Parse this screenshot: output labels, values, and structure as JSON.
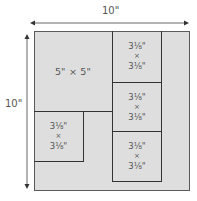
{
  "diagram": {
    "width_label": "10\"",
    "height_label": "10\"",
    "colors": {
      "fill": "#dedede",
      "outer_border": "#5a5a5a",
      "inner_lines": "#333333",
      "text": "#555555"
    },
    "big_square": {
      "label": "5\" × 5\""
    },
    "small_squares": [
      {
        "position": "right-column-top",
        "w": "3⅛\"",
        "x": "×",
        "h": "3⅛\""
      },
      {
        "position": "right-column-middle",
        "w": "3⅛\"",
        "x": "×",
        "h": "3⅛\""
      },
      {
        "position": "right-column-bottom",
        "w": "3⅛\"",
        "x": "×",
        "h": "3⅛\""
      },
      {
        "position": "left-bottom",
        "w": "3⅛\"",
        "x": "×",
        "h": "3⅛\""
      }
    ]
  }
}
